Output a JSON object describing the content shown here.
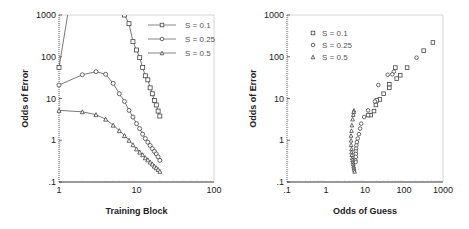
{
  "chart_data": [
    {
      "type": "line",
      "title": "",
      "xlabel": "Training Block",
      "ylabel": "Odds of Error",
      "xscale": "log",
      "yscale": "log",
      "xlim": [
        1,
        100
      ],
      "ylim": [
        0.1,
        1000
      ],
      "x_ticks": [
        "1",
        "10",
        "100"
      ],
      "y_ticks": [
        ".1",
        "1",
        "10",
        "100",
        "1000"
      ],
      "legend_position": "upper right",
      "series": [
        {
          "name": "S = 0.1",
          "marker": "square",
          "x": [
            1,
            7,
            8,
            9,
            10,
            11,
            12,
            13,
            14,
            15,
            16,
            17,
            18,
            19,
            20
          ],
          "y": [
            55,
            1000,
            620,
            230,
            145,
            95,
            55,
            35,
            28,
            18,
            13,
            9,
            7,
            5,
            3.8
          ]
        },
        {
          "name": "S = 0.25",
          "marker": "circle",
          "x": [
            1,
            2,
            3,
            4,
            5,
            6,
            7,
            8,
            9,
            10,
            11,
            12,
            13,
            14,
            15,
            16,
            17,
            18,
            19,
            20
          ],
          "y": [
            21,
            37,
            44,
            38,
            23,
            13,
            8.5,
            5.2,
            3.6,
            2.5,
            1.9,
            1.4,
            1.1,
            0.9,
            0.75,
            0.63,
            0.54,
            0.47,
            0.4,
            0.33
          ]
        },
        {
          "name": "S = 0.5",
          "marker": "triangle",
          "x": [
            1,
            2,
            3,
            4,
            5,
            6,
            7,
            8,
            9,
            10,
            11,
            12,
            13,
            14,
            15,
            16,
            17,
            18,
            19,
            20
          ],
          "y": [
            5.2,
            4.8,
            4.1,
            3.2,
            2.3,
            1.7,
            1.3,
            1.0,
            0.78,
            0.62,
            0.52,
            0.45,
            0.38,
            0.34,
            0.3,
            0.27,
            0.24,
            0.22,
            0.2,
            0.18
          ]
        }
      ],
      "notes": "S = 0.1 series rises from 55 at block 1 off the top of the plot (line continues above 1000) and re-enters at block 7."
    },
    {
      "type": "scatter",
      "title": "",
      "xlabel": "Odds of Guess",
      "ylabel": "Odds of Error",
      "xscale": "log",
      "yscale": "log",
      "xlim": [
        0.1,
        1000
      ],
      "ylim": [
        0.1,
        1000
      ],
      "x_ticks": [
        ".1",
        "1",
        "10",
        "100",
        "1000"
      ],
      "y_ticks": [
        ".1",
        "1",
        "10",
        "100",
        "1000"
      ],
      "legend_position": "upper left",
      "series": [
        {
          "name": "S = 0.1",
          "marker": "square",
          "x": [
            550,
            320,
            120,
            80,
            65,
            60,
            42,
            42,
            30,
            24,
            20,
            19,
            17,
            14,
            12
          ],
          "y": [
            220,
            140,
            55,
            36,
            30,
            55,
            22,
            18,
            13,
            9.5,
            9,
            7,
            5,
            4,
            4
          ]
        },
        {
          "name": "S = 0.25",
          "marker": "circle",
          "x": [
            210,
            55,
            50,
            38,
            22,
            18,
            12,
            9.5,
            8,
            7.5,
            7,
            6.5,
            6.2,
            6,
            5.9,
            5.8,
            5.8,
            5.8,
            5.7,
            5.7
          ],
          "y": [
            95,
            44,
            38,
            37,
            21,
            8.5,
            5.2,
            3.6,
            2.5,
            1.9,
            1.4,
            1.1,
            0.9,
            0.75,
            0.63,
            0.54,
            0.47,
            0.4,
            0.33,
            0.3
          ]
        },
        {
          "name": "S = 0.5",
          "marker": "triangle",
          "x": [
            5.2,
            5.1,
            5.0,
            4.8,
            4.6,
            4.5,
            4.4,
            4.4,
            4.4,
            4.5,
            4.5,
            4.6,
            4.7,
            4.8,
            4.9,
            5.0,
            5.1,
            5.2,
            5.3,
            5.4
          ],
          "y": [
            5.2,
            4.8,
            4.1,
            3.2,
            2.3,
            1.7,
            1.3,
            1.0,
            0.78,
            0.62,
            0.52,
            0.45,
            0.38,
            0.34,
            0.3,
            0.27,
            0.24,
            0.22,
            0.2,
            0.18
          ]
        }
      ]
    }
  ]
}
